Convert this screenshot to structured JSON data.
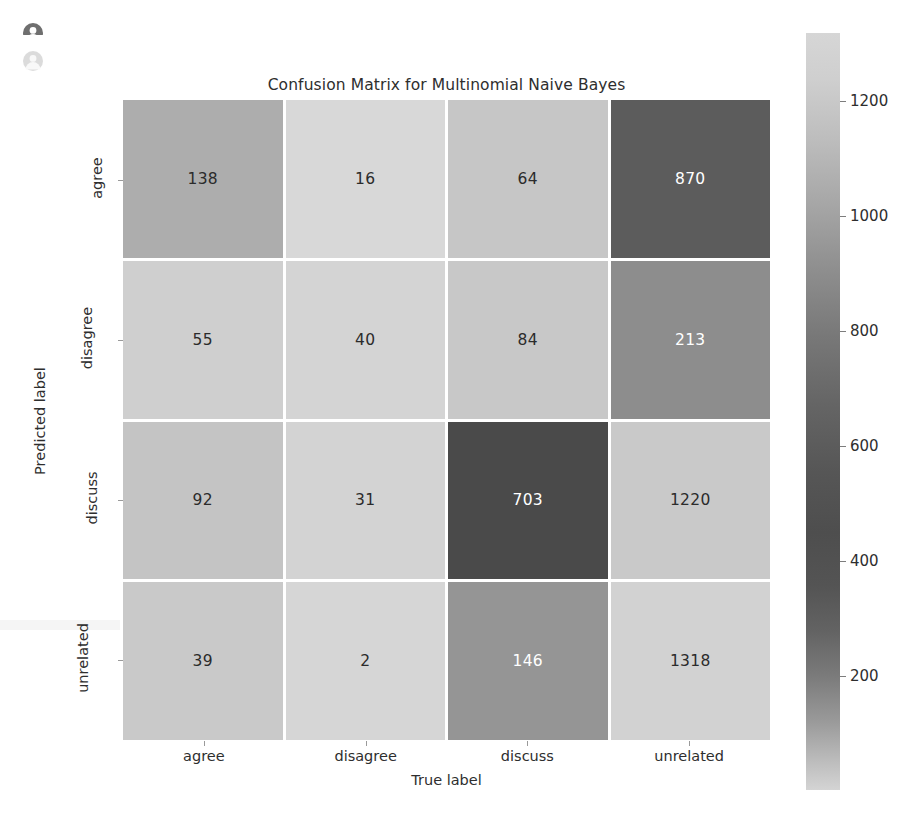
{
  "stray_icons": [
    {
      "name": "user-avatar-icon-clipped"
    },
    {
      "name": "user-avatar-icon-faded"
    }
  ],
  "figure": {
    "title": "Confusion Matrix for Multinomial Naive Bayes",
    "xaxis_label": "True label",
    "yaxis_label": "Predicted label"
  },
  "chart_data": {
    "type": "heatmap",
    "title": "Confusion Matrix for Multinomial Naive Bayes",
    "xlabel": "True label",
    "ylabel": "Predicted label",
    "x_categories": [
      "agree",
      "disagree",
      "discuss",
      "unrelated"
    ],
    "y_categories": [
      "agree",
      "disagree",
      "discuss",
      "unrelated"
    ],
    "values": [
      [
        138,
        16,
        64,
        870
      ],
      [
        55,
        40,
        84,
        213
      ],
      [
        92,
        31,
        703,
        1220
      ],
      [
        39,
        2,
        146,
        1318
      ]
    ],
    "cell_colors": [
      [
        "#adadad",
        "#d8d8d8",
        "#c6c6c6",
        "#5c5c5c"
      ],
      [
        "#cfcfcf",
        "#d4d4d4",
        "#c8c8c8",
        "#8d8d8d"
      ],
      [
        "#c4c4c4",
        "#d3d3d3",
        "#4a4a4a",
        "#c9c9c9"
      ],
      [
        "#c9c9c9",
        "#d6d6d6",
        "#959595",
        "#d2d2d2"
      ]
    ],
    "cell_text_colors": [
      [
        "#2b2b2b",
        "#2b2b2b",
        "#2b2b2b",
        "#ffffff"
      ],
      [
        "#2b2b2b",
        "#2b2b2b",
        "#2b2b2b",
        "#ffffff"
      ],
      [
        "#2b2b2b",
        "#2b2b2b",
        "#ffffff",
        "#2b2b2b"
      ],
      [
        "#2b2b2b",
        "#2b2b2b",
        "#ffffff",
        "#2b2b2b"
      ]
    ],
    "grid": true,
    "gridline_color": "#ffffff",
    "colorbar": {
      "ticks": [
        1200,
        1000,
        800,
        600,
        400,
        200
      ],
      "tick_labels": [
        "1200",
        "1000",
        "800",
        "600",
        "400",
        "200"
      ],
      "position": "right",
      "vmin": 2,
      "vmax": 1318
    }
  }
}
